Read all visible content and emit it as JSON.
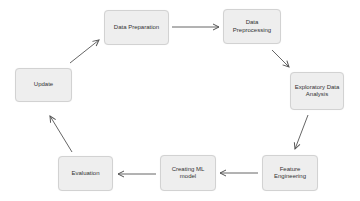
{
  "diagram": {
    "type": "cycle-flowchart",
    "nodes": [
      {
        "id": "data_preparation",
        "label": "Data Preparation"
      },
      {
        "id": "data_preprocessing",
        "label": "Data Preprocessing"
      },
      {
        "id": "eda",
        "label": "Exploratory Data Analysis"
      },
      {
        "id": "feature_engineering",
        "label": "Feature Engineering"
      },
      {
        "id": "creating_ml_model",
        "label": "Creating ML model"
      },
      {
        "id": "evaluation",
        "label": "Evaluation"
      },
      {
        "id": "update",
        "label": "Update"
      }
    ],
    "edges": [
      {
        "from": "data_preparation",
        "to": "data_preprocessing"
      },
      {
        "from": "data_preprocessing",
        "to": "eda"
      },
      {
        "from": "eda",
        "to": "feature_engineering"
      },
      {
        "from": "feature_engineering",
        "to": "creating_ml_model"
      },
      {
        "from": "creating_ml_model",
        "to": "evaluation"
      },
      {
        "from": "evaluation",
        "to": "update"
      },
      {
        "from": "update",
        "to": "data_preparation"
      }
    ],
    "colors": {
      "node_fill": "#eeeeee",
      "node_border": "#d2d2d2",
      "arrow": "#555555",
      "text": "#333333"
    }
  }
}
